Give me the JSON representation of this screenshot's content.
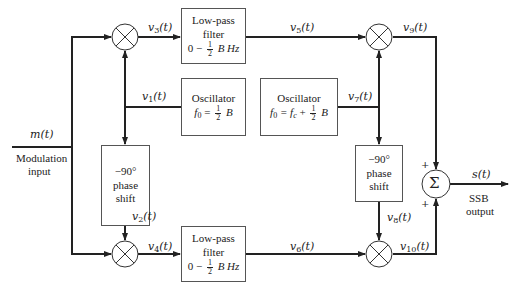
{
  "diagram": {
    "type": "block-diagram",
    "input": {
      "signal": "m(t)",
      "caption_line1": "Modulation",
      "caption_line2": "input"
    },
    "output": {
      "signal": "s(t)",
      "caption_line1": "SSB",
      "caption_line2": "output"
    },
    "blocks": {
      "lpf_top": {
        "line1": "Low-pass",
        "line2": "filter",
        "range_prefix": "0 −",
        "frac_num": "1",
        "frac_den": "2",
        "range_suffix": "B Hz"
      },
      "lpf_bottom": {
        "line1": "Low-pass",
        "line2": "filter",
        "range_prefix": "0 −",
        "frac_num": "1",
        "frac_den": "2",
        "range_suffix": "B Hz"
      },
      "osc1": {
        "title": "Oscillator",
        "eq_prefix": "f",
        "eq_sub": "0",
        "eq_mid": " = ",
        "frac_num": "1",
        "frac_den": "2",
        "eq_suffix": "B"
      },
      "osc2": {
        "title": "Oscillator",
        "eq_prefix": "f",
        "eq_sub": "0",
        "eq_mid": " = f",
        "eq_sub2": "c",
        "eq_plus": " + ",
        "frac_num": "1",
        "frac_den": "2",
        "eq_suffix": "B"
      },
      "phase_left": {
        "line1": "−90°",
        "line2": "phase",
        "line3": "shift"
      },
      "phase_right": {
        "line1": "−90°",
        "line2": "phase",
        "line3": "shift"
      },
      "summer": {
        "symbol": "Σ",
        "plus_top": "+",
        "plus_bottom": "+"
      },
      "mixer_symbol": "×"
    },
    "signals": {
      "v1": {
        "base": "v",
        "sub": "1",
        "arg": "(t)"
      },
      "v2": {
        "base": "v",
        "sub": "2",
        "arg": "(t)"
      },
      "v3": {
        "base": "v",
        "sub": "3",
        "arg": "(t)"
      },
      "v4": {
        "base": "v",
        "sub": "4",
        "arg": "(t)"
      },
      "v5": {
        "base": "v",
        "sub": "5",
        "arg": "(t)"
      },
      "v6": {
        "base": "v",
        "sub": "6",
        "arg": "(t)"
      },
      "v7": {
        "base": "v",
        "sub": "7",
        "arg": "(t)"
      },
      "v8": {
        "base": "v",
        "sub": "8",
        "arg": "(t)"
      },
      "v9": {
        "base": "v",
        "sub": "9",
        "arg": "(t)"
      },
      "v10": {
        "base": "v",
        "sub": "10",
        "arg": "(t)"
      }
    },
    "colors": {
      "line": "#222222",
      "box_border": "#555555",
      "background": "#ffffff"
    }
  }
}
